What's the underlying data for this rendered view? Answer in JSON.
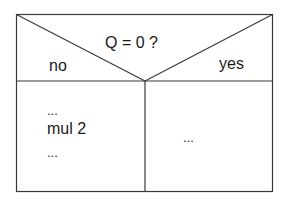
{
  "diagram": {
    "type": "nassi-shneiderman-decision",
    "condition": "Q = 0 ?",
    "branch_left_label": "no",
    "branch_right_label": "yes",
    "left_block": {
      "line1": "...",
      "line2": "mul 2",
      "line3": "..."
    },
    "right_block": {
      "line1": "..."
    },
    "colors": {
      "line": "#3a3a3a",
      "text": "#1a1a1a",
      "background": "#ffffff"
    }
  }
}
